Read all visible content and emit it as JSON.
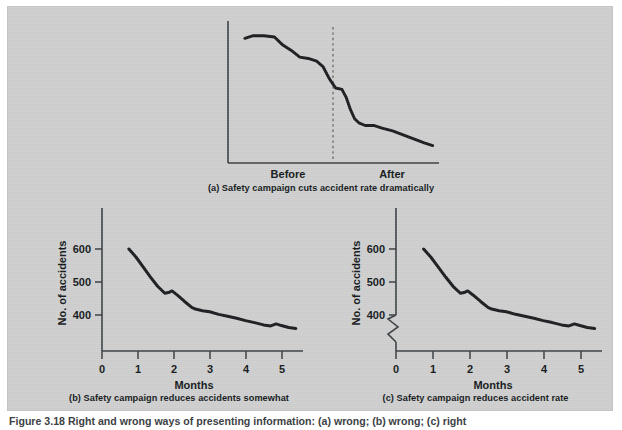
{
  "figure": {
    "background_color": "#cfd0cf",
    "ink_color": "#16191c",
    "caption": "Figure 3.18  Right and wrong ways of presenting information: (a) wrong; (b) wrong; (c) right"
  },
  "panels": {
    "a": {
      "caption": "(a) Safety campaign cuts accident rate dramatically",
      "x_labels": [
        "Before",
        "After"
      ]
    },
    "b": {
      "caption": "(b) Safety campaign reduces accidents somewhat",
      "ylabel": "No. of accidents",
      "xlabel": "Months",
      "y_ticks": [
        "400",
        "500",
        "600"
      ],
      "x_ticks": [
        "0",
        "1",
        "2",
        "3",
        "4",
        "5"
      ]
    },
    "c": {
      "caption": "(c) Safety campaign reduces accident rate",
      "ylabel": "No. of accidents",
      "xlabel": "Months",
      "y_ticks": [
        "400",
        "500",
        "600"
      ],
      "x_ticks": [
        "0",
        "1",
        "2",
        "3",
        "4",
        "5"
      ],
      "axis_break": "zigzag-break-symbol"
    }
  },
  "chart_data": [
    {
      "type": "line",
      "id": "a",
      "title": "(a) Safety campaign cuts accident rate dramatically",
      "xlabel": "",
      "ylabel": "",
      "grid": false,
      "legend": null,
      "annotations": [
        {
          "type": "vertical-dashed-line",
          "x": 0.62,
          "label": "campaign start"
        }
      ],
      "tick_labels": {
        "x": [
          "Before",
          "After"
        ],
        "y": []
      },
      "note": "Unlabelled truncated vertical scale exaggerates the drop.",
      "x": [
        0.08,
        0.12,
        0.17,
        0.22,
        0.26,
        0.3,
        0.34,
        0.38,
        0.42,
        0.45,
        0.48,
        0.51,
        0.54,
        0.56,
        0.58,
        0.6,
        0.62,
        0.65,
        0.69,
        0.73,
        0.78,
        0.83,
        0.88,
        0.93,
        0.97
      ],
      "y": [
        0.93,
        0.95,
        0.95,
        0.94,
        0.88,
        0.84,
        0.79,
        0.78,
        0.76,
        0.72,
        0.63,
        0.56,
        0.55,
        0.49,
        0.4,
        0.33,
        0.3,
        0.28,
        0.28,
        0.26,
        0.24,
        0.21,
        0.18,
        0.15,
        0.13
      ]
    },
    {
      "type": "line",
      "id": "b",
      "title": "(b) Safety campaign reduces accidents somewhat",
      "xlabel": "Months",
      "ylabel": "No. of accidents",
      "grid": false,
      "legend": null,
      "xlim": [
        0,
        5.6
      ],
      "ylim": [
        300,
        680
      ],
      "y_ticks": [
        400,
        500,
        600
      ],
      "x_ticks": [
        0,
        1,
        2,
        3,
        4,
        5
      ],
      "axis_break": false,
      "note": "Full zero-anchored-looking scale makes the decline look modest.",
      "x": [
        0.75,
        0.95,
        1.15,
        1.35,
        1.55,
        1.75,
        1.85,
        1.95,
        2.1,
        2.3,
        2.5,
        2.6,
        2.8,
        3.0,
        3.25,
        3.5,
        3.75,
        4.0,
        4.25,
        4.5,
        4.7,
        4.85,
        5.0,
        5.2,
        5.4
      ],
      "y": [
        600,
        575,
        545,
        515,
        487,
        466,
        468,
        473,
        460,
        441,
        423,
        418,
        413,
        410,
        402,
        396,
        390,
        383,
        377,
        370,
        367,
        373,
        368,
        362,
        359
      ]
    },
    {
      "type": "line",
      "id": "c",
      "title": "(c) Safety campaign reduces accident rate",
      "xlabel": "Months",
      "ylabel": "No. of accidents",
      "grid": false,
      "legend": null,
      "xlim": [
        0,
        5.6
      ],
      "ylim": [
        300,
        680
      ],
      "y_ticks": [
        400,
        500,
        600
      ],
      "x_ticks": [
        0,
        1,
        2,
        3,
        4,
        5
      ],
      "axis_break": true,
      "note": "Broken (zigzag) y-axis below 400 honestly signals the suppressed zero.",
      "x": [
        0.75,
        0.95,
        1.15,
        1.35,
        1.55,
        1.75,
        1.85,
        1.95,
        2.1,
        2.3,
        2.5,
        2.6,
        2.8,
        3.0,
        3.25,
        3.5,
        3.75,
        4.0,
        4.25,
        4.5,
        4.7,
        4.85,
        5.0,
        5.2,
        5.4
      ],
      "y": [
        600,
        575,
        545,
        515,
        487,
        466,
        468,
        473,
        460,
        441,
        423,
        418,
        413,
        410,
        402,
        396,
        390,
        383,
        377,
        370,
        367,
        373,
        368,
        362,
        359
      ]
    }
  ]
}
